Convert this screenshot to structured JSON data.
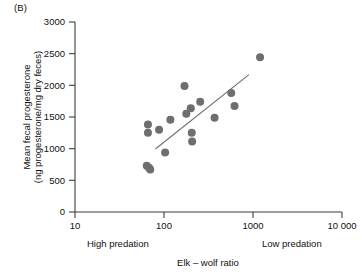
{
  "figure": {
    "panel_label": "(B)"
  },
  "chart_data": {
    "type": "scatter",
    "title": "",
    "xlabel": "Elk – wolf ratio",
    "ylabel": "Mean fecal progesterone (ng progesterone/mg dry feces)",
    "ylabel_line1": "Mean fecal progesterone",
    "ylabel_line2": "(ng progesterone/mg dry feces)",
    "xscale": "log",
    "yscale": "linear",
    "xlim": [
      10,
      10000
    ],
    "ylim": [
      0,
      3000
    ],
    "grid": false,
    "legend": null,
    "xticks": [
      10,
      100,
      1000,
      10000
    ],
    "xtick_labels": [
      "10",
      "100",
      "1000",
      "10 000"
    ],
    "yticks": [
      0,
      500,
      1000,
      1500,
      2000,
      2500,
      3000
    ],
    "ytick_labels": [
      "0",
      "500",
      "1000",
      "1500",
      "2000",
      "2500",
      "3000"
    ],
    "annotations": [
      {
        "text": "High predation",
        "x": 60,
        "y": -520,
        "align": "left"
      },
      {
        "text": "Low predation",
        "x": 1800,
        "y": -520,
        "align": "left"
      }
    ],
    "marker": {
      "shape": "circle",
      "color": "#6e6e6e",
      "size": 5.2
    },
    "points": [
      {
        "x": 66,
        "y": 1380
      },
      {
        "x": 66,
        "y": 1250
      },
      {
        "x": 64,
        "y": 730
      },
      {
        "x": 68,
        "y": 700
      },
      {
        "x": 70,
        "y": 670
      },
      {
        "x": 88,
        "y": 1300
      },
      {
        "x": 103,
        "y": 940
      },
      {
        "x": 118,
        "y": 1455
      },
      {
        "x": 170,
        "y": 1990
      },
      {
        "x": 178,
        "y": 1550
      },
      {
        "x": 200,
        "y": 1640
      },
      {
        "x": 205,
        "y": 1250
      },
      {
        "x": 207,
        "y": 1115
      },
      {
        "x": 255,
        "y": 1740
      },
      {
        "x": 370,
        "y": 1490
      },
      {
        "x": 570,
        "y": 1880
      },
      {
        "x": 620,
        "y": 1675
      },
      {
        "x": 1200,
        "y": 2445
      }
    ],
    "trendline": {
      "type": "linear-fit-on-log-x",
      "color": "#6e6e6e",
      "x_start": 80,
      "y_start": 995,
      "x_end": 900,
      "y_end": 2170
    }
  },
  "colors": {
    "axis": "#3d3d3d",
    "marker": "#6e6e6e",
    "trend": "#6e6e6e",
    "text": "#111111",
    "background": "#ffffff"
  }
}
